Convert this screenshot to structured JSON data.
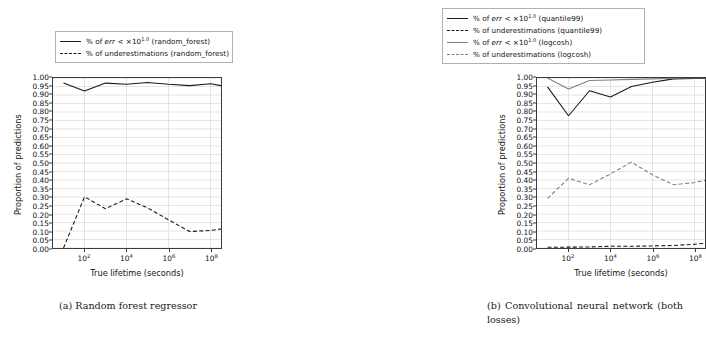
{
  "figure": {
    "panels": [
      {
        "id": "panel-a",
        "caption": "(a) Random forest regressor",
        "legend": [
          {
            "label_html": "% of err < ×10^1.0 (random_forest)",
            "style": "solid",
            "color": "#1a1a1a"
          },
          {
            "label_html": "% of underestimations (random_forest)",
            "style": "dashed",
            "color": "#1a1a1a"
          }
        ]
      },
      {
        "id": "panel-b",
        "caption": "(b) Convolutional neural network (both losses)",
        "legend": [
          {
            "label_html": "% of err < ×10^1.0 (quantile99)",
            "style": "solid",
            "color": "#1a1a1a"
          },
          {
            "label_html": "% of underestimations (quantile99)",
            "style": "dashed",
            "color": "#1a1a1a"
          },
          {
            "label_html": "% of err < ×10^1.0 (logcosh)",
            "style": "solid",
            "color": "#808080"
          },
          {
            "label_html": "% of underestimations (logcosh)",
            "style": "dashed",
            "color": "#808080"
          }
        ]
      }
    ]
  },
  "legend_text": {
    "a": {
      "e0_pre": "% of ",
      "e0_it": "err",
      "e0_mid": " < ×10",
      "e0_sup": "1.0",
      "e0_post": " (random_forest)",
      "e1": "% of underestimations (random_forest)"
    },
    "b": {
      "e0_pre": "% of ",
      "e0_it": "err",
      "e0_mid": " < ×10",
      "e0_sup": "1.0",
      "e0_post": " (quantile99)",
      "e1": "% of underestimations (quantile99)",
      "e2_pre": "% of ",
      "e2_it": "err",
      "e2_mid": " < ×10",
      "e2_sup": "1.0",
      "e2_post": " (logcosh)",
      "e3": "% of underestimations (logcosh)"
    }
  },
  "axes": {
    "ylabel": "Proportion of predictions",
    "xlabel": "True lifetime (seconds)",
    "yticks": [
      "0.00",
      "0.05",
      "0.10",
      "0.15",
      "0.20",
      "0.25",
      "0.30",
      "0.35",
      "0.40",
      "0.45",
      "0.50",
      "0.55",
      "0.60",
      "0.65",
      "0.70",
      "0.75",
      "0.80",
      "0.85",
      "0.90",
      "0.95",
      "1.00"
    ],
    "xticks": [
      {
        "base": "10",
        "exp": "2"
      },
      {
        "base": "10",
        "exp": "4"
      },
      {
        "base": "10",
        "exp": "6"
      },
      {
        "base": "10",
        "exp": "8"
      }
    ]
  },
  "captions": {
    "a": "(a) Random forest regressor",
    "b": "(b) Convolutional neural network (both losses)"
  },
  "chart_data": [
    {
      "type": "line",
      "title": "(a) Random forest regressor",
      "xlabel": "True lifetime (seconds)",
      "ylabel": "Proportion of predictions",
      "xscale": "log",
      "xlim": [
        3.16,
        316000000.0
      ],
      "ylim": [
        0.0,
        1.0
      ],
      "ytick_step": 0.05,
      "grid": true,
      "legend_position": "above-axes",
      "x": [
        10,
        100,
        1000,
        10000,
        100000,
        1000000,
        10000000,
        100000000,
        316227766
      ],
      "series": [
        {
          "name": "% of err < ×10^1.0 (random_forest)",
          "style": "solid",
          "color": "#1a1a1a",
          "values": [
            0.97,
            0.923,
            0.97,
            0.963,
            0.974,
            0.963,
            0.955,
            0.966,
            0.955
          ]
        },
        {
          "name": "% of underestimations (random_forest)",
          "style": "dashed",
          "color": "#1a1a1a",
          "values": [
            0.0,
            0.301,
            0.231,
            0.289,
            0.236,
            0.166,
            0.097,
            0.103,
            0.112
          ]
        }
      ]
    },
    {
      "type": "line",
      "title": "(b) Convolutional neural network (both losses)",
      "xlabel": "True lifetime (seconds)",
      "ylabel": "Proportion of predictions",
      "xscale": "log",
      "xlim": [
        3.16,
        316000000.0
      ],
      "ylim": [
        0.0,
        1.0
      ],
      "ytick_step": 0.05,
      "grid": true,
      "legend_position": "above-axes",
      "x": [
        10,
        100,
        1000,
        10000,
        100000,
        1000000,
        10000000,
        100000000,
        316227766
      ],
      "series": [
        {
          "name": "% of err < ×10^1.0 (quantile99)",
          "style": "solid",
          "color": "#1a1a1a",
          "values": [
            0.948,
            0.778,
            0.925,
            0.888,
            0.95,
            0.975,
            0.995,
            0.998,
            0.998
          ]
        },
        {
          "name": "% of underestimations (quantile99)",
          "style": "dashed",
          "color": "#1a1a1a",
          "values": [
            0.004,
            0.005,
            0.006,
            0.01,
            0.01,
            0.012,
            0.015,
            0.022,
            0.028
          ]
        },
        {
          "name": "% of err < ×10^1.0 (logcosh)",
          "style": "solid",
          "color": "#808080",
          "values": [
            1.0,
            0.935,
            0.985,
            0.988,
            0.992,
            0.995,
            0.999,
            1.0,
            1.0
          ]
        },
        {
          "name": "% of underestimations (logcosh)",
          "style": "dashed",
          "color": "#808080",
          "values": [
            0.292,
            0.41,
            0.372,
            0.436,
            0.505,
            0.43,
            0.372,
            0.385,
            0.398
          ]
        }
      ]
    }
  ]
}
